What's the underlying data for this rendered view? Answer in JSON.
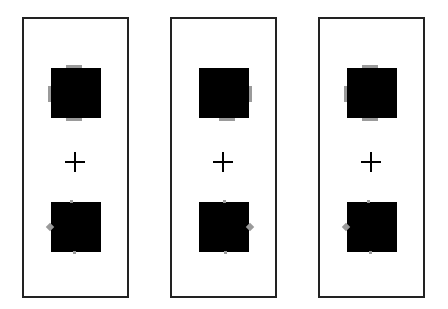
{
  "figure": {
    "colors": {
      "square": "#000000",
      "marker": "#9a9a9a",
      "border": "#222222",
      "background": "#ffffff"
    },
    "panels": [
      {
        "id": "panel-1",
        "fixation": "+",
        "top_square": {
          "markers": [
            "top-bar",
            "left-bar",
            "bottom-bar"
          ]
        },
        "bottom_square": {
          "markers": [
            "top-dot",
            "left-diamond",
            "bottom-dot"
          ]
        }
      },
      {
        "id": "panel-2",
        "fixation": "+",
        "top_square": {
          "markers": [
            "right-bar",
            "bottom-bar"
          ]
        },
        "bottom_square": {
          "markers": [
            "top-dot",
            "right-diamond",
            "bottom-dot"
          ]
        }
      },
      {
        "id": "panel-3",
        "fixation": "+",
        "top_square": {
          "markers": [
            "top-bar",
            "left-bar",
            "bottom-bar"
          ]
        },
        "bottom_square": {
          "markers": [
            "top-dot",
            "left-diamond",
            "bottom-dot"
          ]
        }
      }
    ]
  }
}
